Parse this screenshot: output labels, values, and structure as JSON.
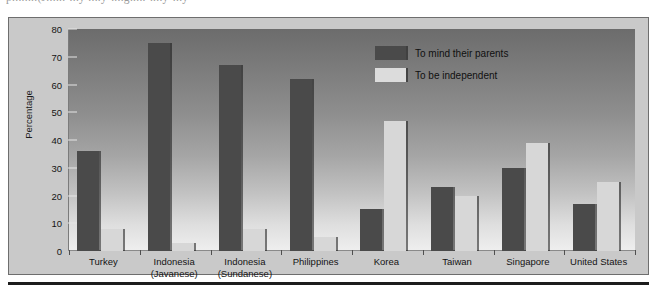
{
  "page": {
    "top_cut_text": "p........(J......-...y ....y-....g.....-....y-...y"
  },
  "chart_data": {
    "type": "bar",
    "title": "",
    "xlabel": "",
    "ylabel": "Percentage",
    "ylim": [
      0,
      80
    ],
    "yticks": [
      0,
      10,
      20,
      30,
      40,
      50,
      60,
      70,
      80
    ],
    "grid": false,
    "legend_position": "top-right",
    "categories": [
      "Turkey",
      "Indonesia\n(Javanese)",
      "Indonesia\n(Sundanese)",
      "Philippines",
      "Korea",
      "Taiwan",
      "Singapore",
      "United States"
    ],
    "category_lines": [
      [
        "Turkey"
      ],
      [
        "Indonesia",
        "(Javanese)"
      ],
      [
        "Indonesia",
        "(Sundanese)"
      ],
      [
        "Philippines"
      ],
      [
        "Korea"
      ],
      [
        "Taiwan"
      ],
      [
        "Singapore"
      ],
      [
        "United States"
      ]
    ],
    "series": [
      {
        "name": "To  mind their parents",
        "color": "#4a4a4a",
        "values": [
          36,
          75,
          67,
          62,
          15,
          23,
          30,
          17
        ]
      },
      {
        "name": "To be independent",
        "color": "#d7d7d7",
        "values": [
          8,
          3,
          8,
          5,
          47,
          20,
          39,
          25
        ]
      }
    ]
  },
  "legend": {
    "items": [
      {
        "label": "To  mind their parents",
        "swatch": "dark"
      },
      {
        "label": "To be independent",
        "swatch": "light"
      }
    ]
  },
  "axis": {
    "y_title": "Percentage",
    "y_tick_labels": [
      "0",
      "10",
      "20",
      "30",
      "40",
      "50",
      "60",
      "70",
      "80"
    ]
  },
  "colors": {
    "bar_dark": "#4a4a4a",
    "bar_light": "#d7d7d7",
    "panel_background": "#c9c9c9",
    "plot_top": "#6c6c6c",
    "plot_bottom": "#efefef",
    "rule": "#1c1c1c"
  }
}
